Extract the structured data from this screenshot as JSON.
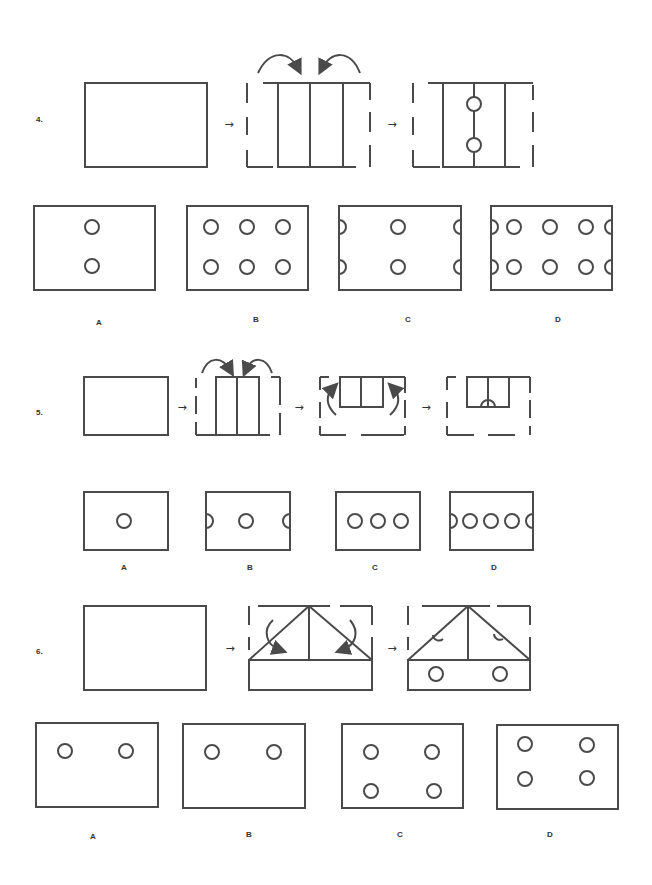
{
  "questions": [
    {
      "number": "4.",
      "steps_arrow": "→",
      "options": [
        {
          "label": "A",
          "holes": "2 holes, center column"
        },
        {
          "label": "B",
          "holes": "6 holes, 2 rows × 3"
        },
        {
          "label": "C",
          "holes": "2 center holes + 4 half-holes at edges"
        },
        {
          "label": "D",
          "holes": "6 holes + 4 half-holes at edges"
        }
      ]
    },
    {
      "number": "5.",
      "steps_arrow": "→",
      "options": [
        {
          "label": "A",
          "holes": "1 center hole"
        },
        {
          "label": "B",
          "holes": "1 center hole + 2 half-holes at edges"
        },
        {
          "label": "C",
          "holes": "3 holes in a row"
        },
        {
          "label": "D",
          "holes": "4 holes + 2 half-holes at edges"
        }
      ]
    },
    {
      "number": "6.",
      "steps_arrow": "→",
      "options": [
        {
          "label": "A",
          "holes": "2 holes, upper row"
        },
        {
          "label": "B",
          "holes": "2 holes, upper row"
        },
        {
          "label": "C",
          "holes": "4 holes, 2 × 2"
        },
        {
          "label": "D",
          "holes": "4 holes, 2 × 2 (higher)"
        }
      ]
    }
  ],
  "colors": {
    "stroke": "#4a4a4a",
    "background": "#ffffff"
  }
}
